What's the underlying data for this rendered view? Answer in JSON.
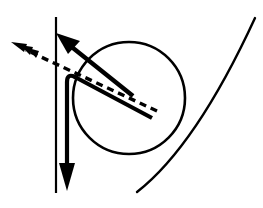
{
  "canvas": {
    "width": 263,
    "height": 208,
    "background": "#ffffff",
    "stroke_color": "#000000"
  },
  "diagram": {
    "type": "line-diagram",
    "elements": [
      {
        "name": "circle",
        "role": "ball-outline",
        "shape": "circle",
        "center": [
          129,
          98
        ],
        "radius": 56,
        "stroke": "#000000",
        "stroke_width": 2.6,
        "fill": "none"
      },
      {
        "name": "vertical-reference-line",
        "role": "axis-line",
        "shape": "line",
        "from": [
          56,
          17
        ],
        "to": [
          56,
          193
        ],
        "stroke": "#000000",
        "stroke_width": 2.2,
        "style": "solid"
      },
      {
        "name": "bent-force-polyline",
        "role": "thick-path-with-down-arrow",
        "shape": "polyline",
        "points": [
          [
            67,
            185
          ],
          [
            67,
            82
          ],
          [
            74,
            74
          ],
          [
            152,
            118
          ]
        ],
        "corner_radius": 9,
        "stroke": "#000000",
        "stroke_width": 4.2,
        "style": "solid",
        "arrowhead": "down",
        "arrow_tip": [
          67,
          190
        ]
      },
      {
        "name": "solid-velocity-arrow",
        "role": "up-left-arrow",
        "shape": "line",
        "from": [
          133,
          96
        ],
        "to": [
          60,
          37
        ],
        "stroke": "#000000",
        "stroke_width": 4.4,
        "style": "solid",
        "arrowhead": "up-left",
        "arrow_tip": [
          57,
          34
        ]
      },
      {
        "name": "dashed-direction-arrow",
        "role": "dashed-arrow",
        "shape": "line",
        "from": [
          157,
          111
        ],
        "to": [
          20,
          47
        ],
        "stroke": "#000000",
        "stroke_width": 3.4,
        "style": "dashed",
        "dash_pattern": "7 5",
        "arrowhead": "barbed-left",
        "arrow_tip": [
          11,
          43
        ]
      },
      {
        "name": "right-curve",
        "role": "curved-boundary-arc",
        "shape": "curve",
        "from": [
          137,
          192
        ],
        "control": [
          196,
          146
        ],
        "to": [
          255,
          18
        ],
        "stroke": "#000000",
        "stroke_width": 2.4,
        "style": "solid",
        "fill": "none"
      }
    ]
  }
}
